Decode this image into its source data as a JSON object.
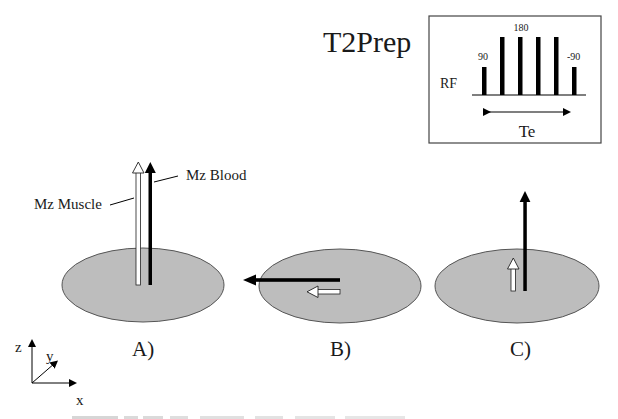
{
  "title": "T2Prep",
  "inset": {
    "rf_label": "RF",
    "pulse_labels": {
      "first": "90",
      "middle": "180",
      "last": "-90"
    },
    "pulses": [
      {
        "x": 484,
        "height": "short"
      },
      {
        "x": 502,
        "height": "tall"
      },
      {
        "x": 520,
        "height": "tall"
      },
      {
        "x": 538,
        "height": "tall"
      },
      {
        "x": 556,
        "height": "tall"
      },
      {
        "x": 574,
        "height": "short"
      }
    ],
    "te_label": "Te"
  },
  "panels": [
    {
      "label": "A)",
      "annotations": {
        "muscle": "Mz Muscle",
        "blood": "Mz Blood"
      }
    },
    {
      "label": "B)"
    },
    {
      "label": "C)"
    }
  ],
  "axes": {
    "z": "z",
    "y": "y",
    "x": "x"
  },
  "colors": {
    "disc_fill": "#bdbdbd",
    "disc_stroke": "#555555",
    "blood_arrow": "#000000",
    "muscle_arrow": "#ffffff"
  }
}
